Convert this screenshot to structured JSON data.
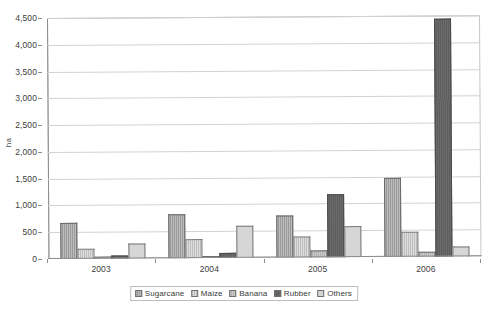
{
  "chart_data": {
    "type": "bar",
    "title": "",
    "xlabel": "",
    "ylabel": "ha",
    "ylim": [
      0,
      4500
    ],
    "ytick_step": 500,
    "grid": true,
    "legend_position": "bottom",
    "categories": [
      "2003",
      "2004",
      "2005",
      "2006"
    ],
    "ytick_labels": [
      "4,500",
      "4,000",
      "3,500",
      "3,000",
      "2,500",
      "2,000",
      "1,500",
      "1,000",
      "500",
      "0"
    ],
    "series": [
      {
        "name": "Sugarcane",
        "values": [
          670,
          820,
          780,
          1470
        ],
        "color": "#9a9a9a"
      },
      {
        "name": "Maize",
        "values": [
          190,
          350,
          390,
          470
        ],
        "color": "#dedede"
      },
      {
        "name": "Banana",
        "values": [
          30,
          40,
          130,
          100
        ],
        "color": "#b4b4b4"
      },
      {
        "name": "Rubber",
        "values": [
          60,
          100,
          1180,
          4450
        ],
        "color": "#5e5e5e"
      },
      {
        "name": "Others",
        "values": [
          280,
          590,
          580,
          190
        ],
        "color": "#d6d6d6"
      }
    ]
  },
  "axis": {
    "y_title": "ha"
  }
}
